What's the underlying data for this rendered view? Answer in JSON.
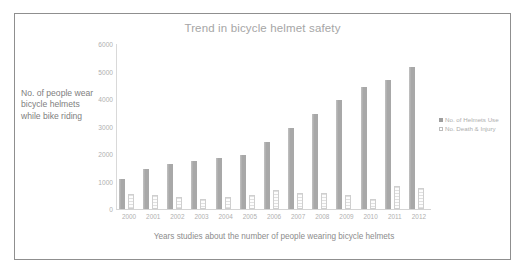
{
  "chart_data": {
    "type": "bar",
    "title": "Trend in bicycle helmet safety",
    "xlabel": "Years studies about the number of people wearing bicycle helmets",
    "ylabel": "No. of people wear bicycle helmets while bike riding",
    "categories": [
      "2000",
      "2001",
      "2002",
      "2003",
      "2004",
      "2005",
      "2006",
      "2007",
      "2008",
      "2009",
      "2010",
      "2011",
      "2012"
    ],
    "series": [
      {
        "name": "No. of Helmets Use",
        "color": "#a8a8a8",
        "values": [
          1100,
          1450,
          1620,
          1730,
          1840,
          1950,
          2450,
          2950,
          3450,
          3950,
          4450,
          4700,
          5150
        ]
      },
      {
        "name": "No. Death & Injury",
        "color": "#ffffff",
        "values": [
          560,
          500,
          440,
          380,
          430,
          520,
          700,
          600,
          600,
          510,
          380,
          820,
          780
        ]
      }
    ],
    "ylim": [
      0,
      6000
    ],
    "yticks": [
      0,
      1000,
      2000,
      3000,
      4000,
      5000,
      6000
    ],
    "ytick_labels": [
      "0",
      "1000",
      "2000",
      "3000",
      "4000",
      "5000",
      "6000"
    ],
    "grid": false,
    "legend_position": "right"
  },
  "legend": {
    "items": [
      {
        "label": "No. of Helmets Use",
        "swatch": "primary"
      },
      {
        "label": "No. Death & Injury",
        "swatch": "secondary"
      }
    ]
  }
}
